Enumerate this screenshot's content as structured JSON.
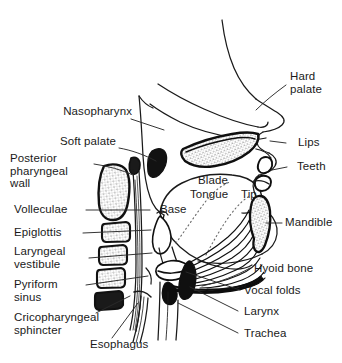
{
  "figure": {
    "background_color": "#ffffff",
    "ink_color": "#1a1a1a",
    "width": 342,
    "height": 363
  },
  "labels": {
    "nasopharynx": "Nasopharynx",
    "soft_palate": "Soft palate",
    "posterior_pharyngeal_wall": "Posterior\npharyngeal\nwall",
    "volleculae": "Volleculae",
    "epiglottis": "Epiglottis",
    "laryngeal_vestibule": "Laryngeal\nvestibule",
    "pyriform_sinus": "Pyriform\nsinus",
    "cricopharyngeal_sphincter": "Cricopharyngeal\nsphincter",
    "esophagus": "Esophagus",
    "hard_palate": "Hard\npalate",
    "lips": "Lips",
    "teeth": "Teeth",
    "mandible": "Mandible",
    "hyoid_bone": "Hyoid bone",
    "vocal_folds": "Vocal folds",
    "larynx": "Larynx",
    "trachea": "Trachea",
    "blade": "Blade",
    "tongue": "Tongue",
    "tip": "Tip",
    "base": "Base"
  },
  "structures": [
    "nasal-cavity",
    "hard-palate",
    "soft-palate",
    "nasopharynx",
    "posterior-pharyngeal-wall",
    "cervical-vertebrae",
    "tongue",
    "tongue-blade",
    "tongue-tip",
    "tongue-base",
    "mandible",
    "teeth",
    "lips",
    "epiglottis",
    "volleculae",
    "laryngeal-vestibule",
    "pyriform-sinus",
    "hyoid-bone",
    "vocal-folds",
    "larynx",
    "trachea",
    "esophagus",
    "cricopharyngeal-sphincter"
  ]
}
